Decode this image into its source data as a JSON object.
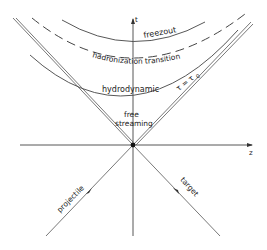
{
  "diagram": {
    "type": "spacetime-diagram",
    "axes": {
      "t_label": "t",
      "z_label": "z"
    },
    "regions": {
      "freezout": "freezout",
      "hadronization": "hadronization transition",
      "hydrodynamic": "hydrodynamic",
      "free_streaming_line1": "free",
      "free_streaming_line2": "streaming",
      "tau_eq": "τ = τ",
      "tau_sub": "0"
    },
    "beams": {
      "projectile": "projectile",
      "target": "target"
    },
    "colors": {
      "line": "#444444",
      "text": "#222222",
      "background": "#ffffff"
    }
  }
}
